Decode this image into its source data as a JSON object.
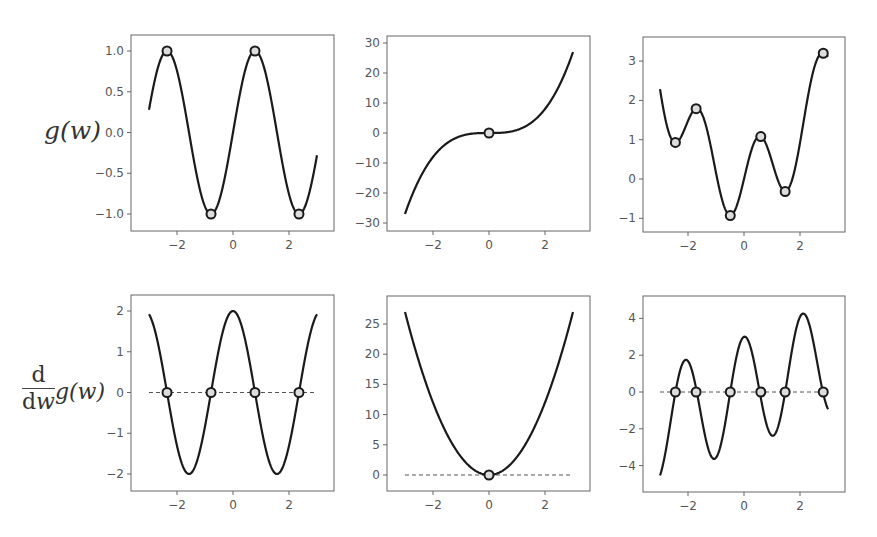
{
  "labels": {
    "row_top_ylabel": "g(w)",
    "row_bottom_ylabel_num": "d",
    "row_bottom_ylabel_den_d": "d",
    "row_bottom_ylabel_den_w": "w",
    "row_bottom_ylabel_rest": "g(w)"
  },
  "style": {
    "line_color": "#1a1a1a",
    "marker_face": "#dddddd",
    "marker_edge": "#1a1a1a",
    "frame_color": "#666666",
    "tick_label_color": "#555555",
    "dashed_color": "#555555"
  },
  "chart_data": [
    {
      "id": "top-left",
      "type": "line",
      "title": "",
      "function": "g(w) = sin(2w)",
      "xlabel": "",
      "ylabel": "g(w)",
      "xlim": [
        -3.64,
        3.64
      ],
      "ylim": [
        -1.2,
        1.2
      ],
      "xticks": [
        -2,
        0,
        2
      ],
      "yticks": [
        1.0,
        0.5,
        0.0,
        -0.5,
        -1.0
      ],
      "ytick_labels": [
        "1.0",
        "0.5",
        "0.0",
        "−0.5",
        "−1.0"
      ],
      "x_range": [
        -3,
        3
      ],
      "stationary_points": [
        [
          -2.356,
          1.0
        ],
        [
          -0.785,
          -1.0
        ],
        [
          0.785,
          1.0
        ],
        [
          2.356,
          -1.0
        ]
      ],
      "zero_line": false,
      "frame": {
        "left": 131,
        "top": 35,
        "right": 334,
        "bottom": 231
      },
      "px": {
        "x0": 233,
        "xs": 28,
        "y0": 132.5,
        "ys": 81.5
      }
    },
    {
      "id": "top-middle",
      "type": "line",
      "function": "g(w) = w^3",
      "xlim": [
        -3.64,
        3.64
      ],
      "ylim": [
        -32,
        32
      ],
      "xticks": [
        -2,
        0,
        2
      ],
      "yticks": [
        30,
        20,
        10,
        0,
        -10,
        -20,
        -30
      ],
      "ytick_labels": [
        "30",
        "20",
        "10",
        "0",
        "−10",
        "−20",
        "−30"
      ],
      "x_range": [
        -3,
        3
      ],
      "stationary_points": [
        [
          0,
          0
        ]
      ],
      "zero_line": false,
      "frame": {
        "left": 387,
        "top": 36,
        "right": 590,
        "bottom": 231
      },
      "px": {
        "x0": 489,
        "xs": 28,
        "y0": 133,
        "ys": 3
      }
    },
    {
      "id": "top-right",
      "type": "line",
      "function": "g(w) = sin(3w) + 0.3w^2",
      "xlim": [
        -3.64,
        3.64
      ],
      "ylim": [
        -1.35,
        3.6
      ],
      "xticks": [
        -2,
        0,
        2
      ],
      "yticks": [
        3,
        2,
        1,
        0,
        -1
      ],
      "ytick_labels": [
        "3",
        "2",
        "1",
        "0",
        "−1"
      ],
      "x_range": [
        -3,
        3
      ],
      "stationary_points": [
        [
          -2.45,
          0.93
        ],
        [
          -1.71,
          1.79
        ],
        [
          -0.49,
          -0.93
        ],
        [
          0.6,
          1.08
        ],
        [
          1.47,
          -0.32
        ],
        [
          2.83,
          3.2
        ]
      ],
      "zero_line": false,
      "frame": {
        "left": 643,
        "top": 37,
        "right": 845,
        "bottom": 232
      },
      "px": {
        "x0": 744,
        "xs": 28,
        "y0": 179,
        "ys": 39.3
      }
    },
    {
      "id": "bottom-left",
      "type": "line",
      "function": "g'(w) = 2cos(2w)",
      "xlabel": "",
      "ylabel": "d/dw g(w)",
      "xlim": [
        -3.64,
        3.64
      ],
      "ylim": [
        -2.4,
        2.4
      ],
      "xticks": [
        -2,
        0,
        2
      ],
      "yticks": [
        2,
        1,
        0,
        -1,
        -2
      ],
      "ytick_labels": [
        "2",
        "1",
        "0",
        "−1",
        "−2"
      ],
      "x_range": [
        -3,
        3
      ],
      "stationary_points": [
        [
          -2.356,
          0
        ],
        [
          -0.785,
          0
        ],
        [
          0.785,
          0
        ],
        [
          2.356,
          0
        ]
      ],
      "zero_line": true,
      "frame": {
        "left": 131,
        "top": 295,
        "right": 334,
        "bottom": 491
      },
      "px": {
        "x0": 233,
        "xs": 28,
        "y0": 392.5,
        "ys": 40.75
      }
    },
    {
      "id": "bottom-middle",
      "type": "line",
      "function": "g'(w) = 3w^2",
      "xlim": [
        -3.64,
        3.64
      ],
      "ylim": [
        -2.7,
        29
      ],
      "xticks": [
        -2,
        0,
        2
      ],
      "yticks": [
        25,
        20,
        15,
        10,
        5,
        0
      ],
      "ytick_labels": [
        "25",
        "20",
        "15",
        "10",
        "5",
        "0"
      ],
      "x_range": [
        -3,
        3
      ],
      "stationary_points": [
        [
          0,
          0
        ]
      ],
      "zero_line": true,
      "frame": {
        "left": 387,
        "top": 296,
        "right": 590,
        "bottom": 491
      },
      "px": {
        "x0": 489,
        "xs": 28,
        "y0": 475,
        "ys": 6.04
      }
    },
    {
      "id": "bottom-right",
      "type": "line",
      "function": "g'(w) = 3cos(3w) + 0.6w",
      "xlim": [
        -3.64,
        3.64
      ],
      "ylim": [
        -5.4,
        5.2
      ],
      "xticks": [
        -2,
        0,
        2
      ],
      "yticks": [
        4,
        2,
        0,
        -2,
        -4
      ],
      "ytick_labels": [
        "4",
        "2",
        "0",
        "−2",
        "−4"
      ],
      "x_range": [
        -3,
        3
      ],
      "stationary_points": [
        [
          -2.45,
          0
        ],
        [
          -1.71,
          0
        ],
        [
          -0.49,
          0
        ],
        [
          0.6,
          0
        ],
        [
          1.47,
          0
        ],
        [
          2.83,
          0
        ]
      ],
      "zero_line": true,
      "frame": {
        "left": 643,
        "top": 296,
        "right": 845,
        "bottom": 492
      },
      "px": {
        "x0": 744,
        "xs": 28,
        "y0": 392,
        "ys": 18.4
      }
    }
  ]
}
